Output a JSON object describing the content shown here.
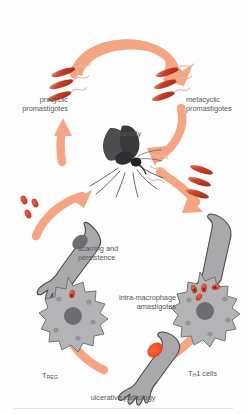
{
  "diagram": {
    "type": "cycle-diagram",
    "background": "#fdfdfd",
    "palette": {
      "arrow": "#f4a584",
      "arrow_light": "#f7bda4",
      "parasite_red": "#c8412a",
      "parasite_red_light": "#e4775c",
      "lesion_red": "#ef4b28",
      "skin_grey": "#a9a9ab",
      "skin_outline": "#4b4b4d",
      "macrophage_grey": "#b4b4b6",
      "nucleus_grey": "#6e6e70",
      "sandfly_dark": "#3a3a3c",
      "text_grey": "#58585a"
    }
  },
  "labels": {
    "procyclic": "procyclic\npromastigotes",
    "procyclic_line1": "procyclic",
    "procyclic_line2": "promastigotes",
    "metacyclic_line1": "metacyclic",
    "metacyclic_line2": "promastigotes",
    "sandfly": "sandfly",
    "scarring_line1": "scarring and",
    "scarring_line2": "persistence",
    "macrophage_line1": "intra-macrophage",
    "macrophage_line2": "amastigotes",
    "treg_main": "T",
    "treg_sub": "REG",
    "th1_main": "T",
    "th1_sub": "H",
    "th1_tail": "1 cells",
    "ulcerative": "ulcerative pathology"
  },
  "elements": {
    "promastigote_clusters": [
      {
        "name": "procyclic-promastigotes",
        "count": 3,
        "position": "upper-left"
      },
      {
        "name": "metacyclic-promastigotes",
        "count": 3,
        "position": "upper-right"
      },
      {
        "name": "injected-promastigotes",
        "count": 3,
        "position": "mid-right"
      }
    ],
    "amastigote_clusters": [
      {
        "name": "free-amastigotes",
        "count": 3,
        "position": "mid-left"
      },
      {
        "name": "macrophage-amastigotes-left",
        "count": 1,
        "position": "lower-left-macrophage"
      },
      {
        "name": "macrophage-amastigotes-right",
        "count": 4,
        "position": "lower-right-macrophage"
      }
    ],
    "arms": [
      {
        "name": "arm-scarring",
        "lesion": "dark-grey",
        "position": "left"
      },
      {
        "name": "arm-infected",
        "lesion": "none",
        "position": "right"
      },
      {
        "name": "arm-ulcerative",
        "lesion": "red",
        "position": "bottom"
      }
    ],
    "macrophages": [
      {
        "name": "macrophage-left",
        "parasites": 1
      },
      {
        "name": "macrophage-right",
        "parasites": 4
      }
    ],
    "insect": {
      "name": "sandfly",
      "color": "#3a3a3c"
    },
    "arrows": [
      {
        "name": "arrow-procyclic-to-metacyclic",
        "direction": "clockwise-top"
      },
      {
        "name": "arrow-metacyclic-to-sandfly-bite",
        "direction": "down-right"
      },
      {
        "name": "arrow-sandfly-to-arm",
        "direction": "down-right"
      },
      {
        "name": "arrow-arm-to-macrophage",
        "direction": "down"
      },
      {
        "name": "arrow-macrophage-to-ulcer",
        "direction": "down-left"
      },
      {
        "name": "arrow-ulcer-to-scarring",
        "direction": "up-left"
      },
      {
        "name": "arrow-amastigotes-to-sandfly",
        "direction": "up-right"
      },
      {
        "name": "arrow-scarring-to-procyclic",
        "direction": "up"
      }
    ]
  }
}
